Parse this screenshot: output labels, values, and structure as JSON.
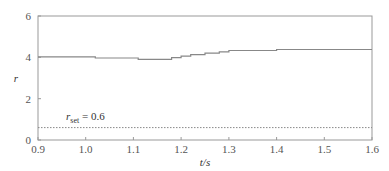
{
  "chart_data": {
    "type": "line",
    "title": "",
    "xlabel": "t/s",
    "ylabel": "r",
    "xlim": [
      0.9,
      1.6
    ],
    "ylim": [
      0,
      6
    ],
    "xticks": [
      0.9,
      1.0,
      1.1,
      1.2,
      1.3,
      1.4,
      1.5,
      1.6
    ],
    "xtick_labels": [
      "0.9",
      "1.0",
      "1.1",
      "1.2",
      "1.3",
      "1.4",
      "1.5",
      "1.6"
    ],
    "yticks": [
      0,
      2,
      4,
      6
    ],
    "ytick_labels": [
      "0",
      "2",
      "4",
      "6"
    ],
    "grid": false,
    "legend": null,
    "series": [
      {
        "name": "r",
        "style": "solid step",
        "color": "#888888",
        "x": [
          0.9,
          1.02,
          1.02,
          1.11,
          1.11,
          1.18,
          1.18,
          1.2,
          1.2,
          1.22,
          1.22,
          1.25,
          1.25,
          1.28,
          1.28,
          1.3,
          1.3,
          1.4,
          1.4,
          1.6
        ],
        "y": [
          4.02,
          4.02,
          3.97,
          3.97,
          3.9,
          3.9,
          3.98,
          3.98,
          4.06,
          4.06,
          4.13,
          4.13,
          4.2,
          4.2,
          4.27,
          4.27,
          4.33,
          4.33,
          4.38,
          4.38
        ]
      },
      {
        "name": "r_set",
        "style": "dotted",
        "color": "#888888",
        "x": [
          0.9,
          1.6
        ],
        "y": [
          0.6,
          0.6
        ]
      }
    ],
    "annotations": [
      {
        "text_main": "r",
        "text_sub": "set",
        "text_rest": " = 0.6",
        "x": 0.94,
        "y": 1.1
      }
    ]
  }
}
